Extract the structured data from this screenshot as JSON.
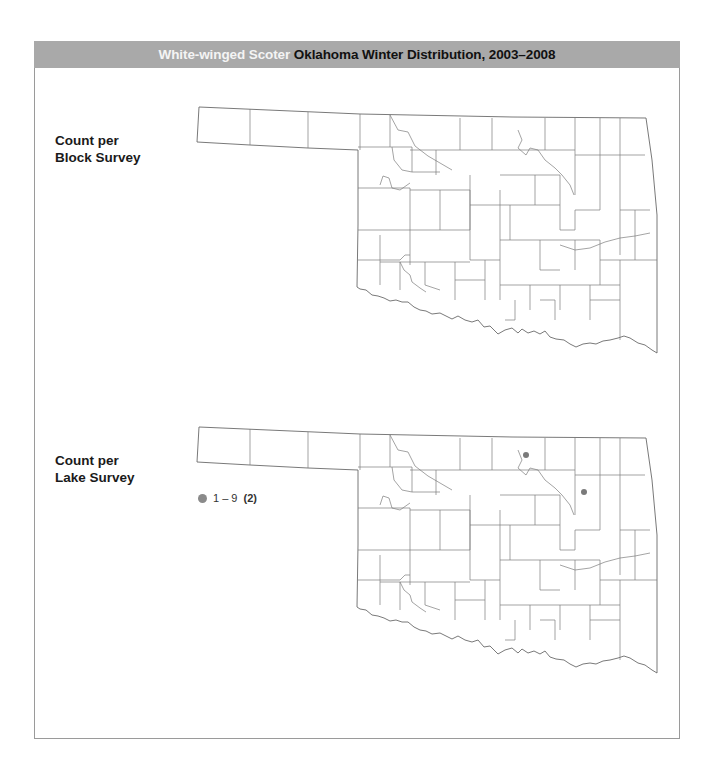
{
  "header": {
    "species": "White-winged Scoter",
    "title_rest": "Oklahoma Winter Distribution, 2003–2008"
  },
  "panels": [
    {
      "label_line1": "Count per",
      "label_line2": "Block Survey",
      "legend": []
    },
    {
      "label_line1": "Count per",
      "label_line2": "Lake Survey",
      "legend": [
        {
          "range": "1 – 9",
          "count": "(2)",
          "symbol": "gray-dot",
          "color": "#8a8a8a"
        }
      ]
    }
  ],
  "observations": {
    "lake_survey": [
      {
        "x": 526,
        "y": 455
      },
      {
        "x": 584,
        "y": 492
      }
    ]
  },
  "colors": {
    "header_bg": "#a9a9a9",
    "species_text": "#f4f4f4",
    "title_text": "#111111",
    "dot": "#8a8a8a",
    "county_lines": "#7c7c7c"
  }
}
